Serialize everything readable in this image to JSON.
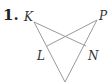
{
  "problem": {
    "number": "1."
  },
  "labels": {
    "K": "K",
    "P": "P",
    "L": "L",
    "N": "N"
  },
  "colors": {
    "line": "#9a9a9a",
    "text": "#333333"
  }
}
